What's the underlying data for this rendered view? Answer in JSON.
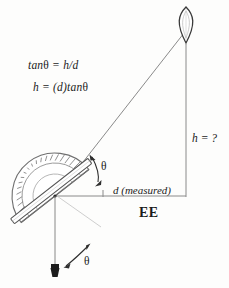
{
  "figure": {
    "type": "geometry-diagram",
    "title_text": "EE",
    "background_color": "#fdfdfc",
    "ink_color": "#1b1b1b",
    "line_color": "#6e6e6e"
  },
  "formulas": {
    "tan": {
      "pre": "tan",
      "theta": "θ",
      "post": " = h/d"
    },
    "height": {
      "pre": "h = (d)tan",
      "theta": "θ",
      "post": ""
    },
    "tan_full": "tanθ = h/d",
    "height_full": "h = (d)tanθ"
  },
  "labels": {
    "unknown_height": "h = ?",
    "measured_distance": "d (measured)",
    "org": "EE",
    "theta_sight": "θ",
    "theta_plumb": "θ"
  },
  "objects": {
    "balloon": {
      "name": "balloon",
      "cx": 186,
      "cy": 26
    },
    "protractor": {
      "name": "protractor",
      "cx": 55,
      "cy": 196,
      "radius": 42
    },
    "sighting_tube": {
      "name": "sighting-tube"
    },
    "plumb_bob": {
      "name": "plumb-bob",
      "x": 55,
      "y": 272
    }
  },
  "geometry": {
    "sight_line": {
      "x1": 57,
      "y1": 196,
      "x2": 184,
      "y2": 32
    },
    "baseline": {
      "x1": 55,
      "y1": 196,
      "x2": 186,
      "y2": 196
    },
    "vertical": {
      "x1": 186,
      "y1": 196,
      "x2": 186,
      "y2": 42
    },
    "plumb_line": {
      "x1": 55,
      "y1": 196,
      "x2": 55,
      "y2": 266
    }
  }
}
